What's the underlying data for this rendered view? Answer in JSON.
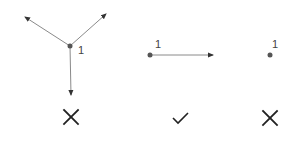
{
  "diagram": {
    "panels": [
      {
        "name": "three-outgoing-edges",
        "node_label": "1",
        "edge_count": 3,
        "verdict": "invalid",
        "verdict_icon": "cross-icon"
      },
      {
        "name": "one-outgoing-edge",
        "node_label": "1",
        "edge_count": 1,
        "verdict": "valid",
        "verdict_icon": "check-icon"
      },
      {
        "name": "no-outgoing-edges",
        "node_label": "1",
        "edge_count": 0,
        "verdict": "invalid",
        "verdict_icon": "cross-icon"
      }
    ],
    "colors": {
      "edge": "#8a8a8a",
      "node": "#555555",
      "icon": "#222222"
    }
  }
}
